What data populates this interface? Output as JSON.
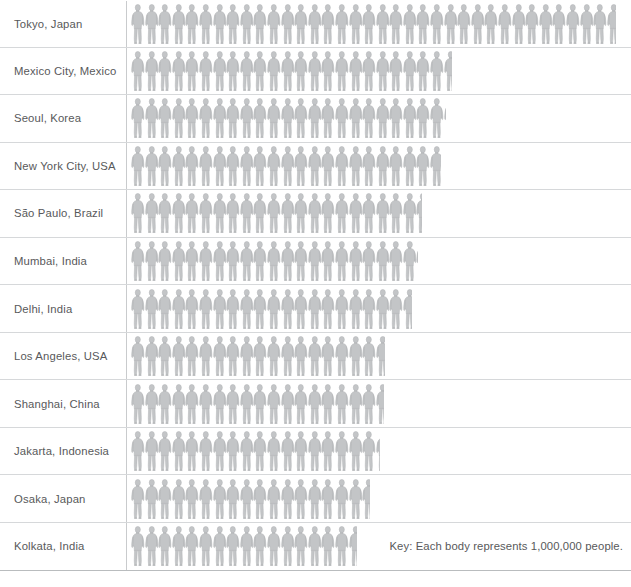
{
  "key": {
    "text": "Key: Each body represents 1,000,000 people.",
    "unit_value": 1000000,
    "icon": "person-icon"
  },
  "colors": {
    "figure": "#c3c5c7",
    "figure_outline": "#b0b3b5",
    "text": "#58595b",
    "rule": "#d6d8da",
    "divider": "#c9cbcd",
    "background": "#ffffff"
  },
  "chart_data": {
    "type": "bar",
    "subtype": "pictogram",
    "title": "",
    "subtitle": "",
    "xlabel": "",
    "ylabel": "",
    "unit": "people",
    "icon_value": 1000000,
    "legend": "Key: Each body represents 1,000,000 people.",
    "grid": false,
    "legend_position": "bottom-right",
    "categories": [
      "Tokyo, Japan",
      "Mexico City, Mexico",
      "Seoul, Korea",
      "New York City, USA",
      "São Paulo, Brazil",
      "Mumbai, India",
      "Delhi, India",
      "Los Angeles, USA",
      "Shanghai, China",
      "Jakarta, Indonesia",
      "Osaka, Japan",
      "Kolkata, India"
    ],
    "values": [
      35.7,
      23.6,
      23.2,
      22.8,
      21.4,
      21.1,
      20.7,
      18.7,
      18.6,
      18.3,
      17.6,
      16.6
    ],
    "values_label": [
      "35,700,000",
      "23,600,000",
      "23,200,000",
      "22,800,000",
      "21,400,000",
      "21,100,000",
      "20,700,000",
      "18,700,000",
      "18,600,000",
      "18,300,000",
      "17,600,000",
      "16,600,000"
    ],
    "xlim": [
      0,
      36
    ],
    "ylim": null
  },
  "rows": [
    {
      "label": "Tokyo, Japan",
      "icons": 35.7
    },
    {
      "label": "Mexico City, Mexico",
      "icons": 23.6
    },
    {
      "label": "Seoul, Korea",
      "icons": 23.2
    },
    {
      "label": "New York City, USA",
      "icons": 22.8
    },
    {
      "label": "São Paulo, Brazil",
      "icons": 21.4
    },
    {
      "label": "Mumbai, India",
      "icons": 21.1
    },
    {
      "label": "Delhi, India",
      "icons": 20.7
    },
    {
      "label": "Los Angeles, USA",
      "icons": 18.7
    },
    {
      "label": "Shanghai, China",
      "icons": 18.6
    },
    {
      "label": "Jakarta, Indonesia",
      "icons": 18.3
    },
    {
      "label": "Osaka, Japan",
      "icons": 17.6
    },
    {
      "label": "Kolkata, India",
      "icons": 16.6
    }
  ]
}
